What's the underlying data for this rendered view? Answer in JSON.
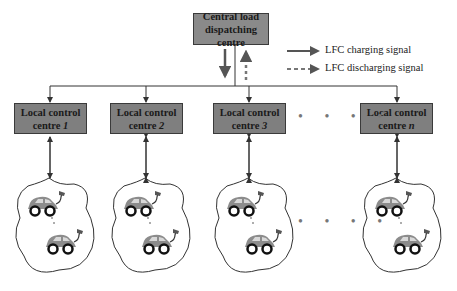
{
  "central": {
    "line1": "Central load",
    "line2": "dispatching centre"
  },
  "legend": {
    "charging": "LFC charging signal",
    "discharging": "LFC discharging signal"
  },
  "local_centres": [
    {
      "line1": "Local control",
      "line2": "centre ",
      "index": "1"
    },
    {
      "line1": "Local control",
      "line2": "centre ",
      "index": "2"
    },
    {
      "line1": "Local control",
      "line2": "centre ",
      "index": "3"
    },
    {
      "line1": "Local control",
      "line2": "centre ",
      "index": "n"
    }
  ],
  "ellipsis": "• • • •",
  "colors": {
    "box_fill": "#7f7f7f",
    "line": "#333333",
    "car_body": "#8c8c8c",
    "legend_arrow": "#555555"
  }
}
